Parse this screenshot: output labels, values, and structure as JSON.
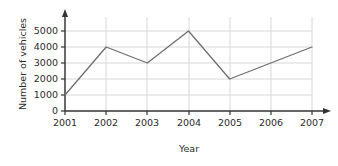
{
  "chart_data": {
    "type": "line",
    "title": "",
    "xlabel": "Year",
    "ylabel": "Number of vehicles",
    "categories": [
      "2001",
      "2002",
      "2003",
      "2004",
      "2005",
      "2006",
      "2007"
    ],
    "values": [
      1000,
      4000,
      3000,
      5000,
      2000,
      3000,
      4000
    ],
    "x": [
      2001,
      2002,
      2003,
      2004,
      2005,
      2006,
      2007
    ],
    "ylim": [
      0,
      5000
    ],
    "yticks": [
      "0",
      "1000",
      "2000",
      "3000",
      "4000",
      "5000"
    ],
    "ytick_values": [
      0,
      1000,
      2000,
      3000,
      4000,
      5000
    ],
    "xticks": [
      "2001",
      "2002",
      "2003",
      "2004",
      "2005",
      "2006",
      "2007"
    ],
    "grid": true,
    "legend": false,
    "legend_position": "none",
    "series": [
      {
        "name": "Number of vehicles",
        "values": [
          1000,
          4000,
          3000,
          5000,
          2000,
          3000,
          4000
        ]
      }
    ],
    "colors": {
      "background": "#ffffff",
      "line": "#6e6e6e",
      "grid": "#d8d8d8",
      "axis": "#333333",
      "text": "#2b2b2b"
    }
  }
}
